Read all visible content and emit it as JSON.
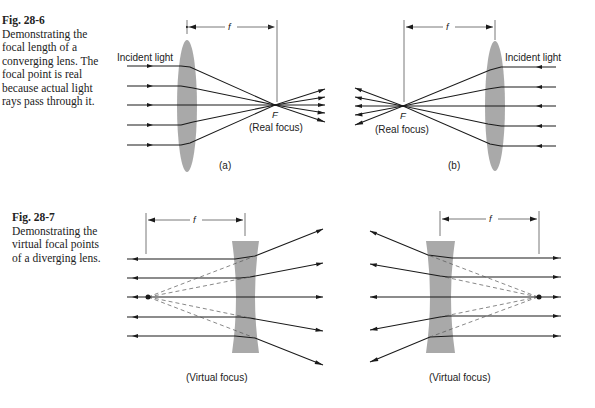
{
  "figures": [
    {
      "id": "28-6",
      "caption_number": "Fig. 28-6",
      "caption_text": "Demonstrating the focal length of a converging lens. The focal point is real because actual light rays pass through it.",
      "panels": [
        {
          "panel_label": "(a)",
          "incident_label": "Incident light",
          "focus_label": "(Real focus)",
          "focal_point_label": "F",
          "focal_length_label": "f",
          "lens_type": "converging",
          "light_direction": "left-to-right"
        },
        {
          "panel_label": "(b)",
          "incident_label": "Incident light",
          "focus_label": "(Real focus)",
          "focal_point_label": "F",
          "focal_length_label": "f",
          "lens_type": "converging",
          "light_direction": "right-to-left"
        }
      ]
    },
    {
      "id": "28-7",
      "caption_number": "Fig. 28-7",
      "caption_text": "Demonstrating the virtual focal points of a diverging lens.",
      "panels": [
        {
          "focus_label": "(Virtual focus)",
          "focal_length_label": "f",
          "lens_type": "diverging",
          "light_direction": "left-to-right"
        },
        {
          "focus_label": "(Virtual focus)",
          "focal_length_label": "f",
          "lens_type": "diverging",
          "light_direction": "right-to-left"
        }
      ]
    }
  ],
  "colors": {
    "lens": "#a9a9a9",
    "ray": "#1a1a1a",
    "guide": "#555555",
    "text": "#222222"
  }
}
